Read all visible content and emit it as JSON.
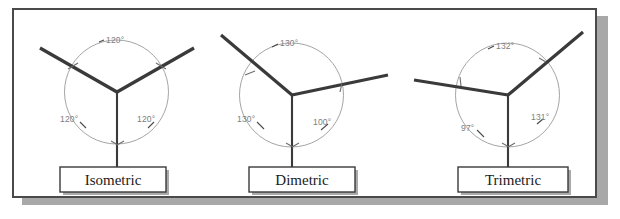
{
  "figure": {
    "background_color": "#ffffff",
    "frame_color": "#4a4a4a",
    "shadow_color": "#a8a8a8",
    "axis_color": "#3a3a3a",
    "arc_color": "#9a9a9a",
    "angle_label_color": "#7d7d7d"
  },
  "diagrams": [
    {
      "id": "isometric",
      "caption": "Isometric",
      "angles": {
        "top": "120°",
        "left": "120°",
        "right": "120°"
      }
    },
    {
      "id": "dimetric",
      "caption": "Dimetric",
      "angles": {
        "top": "130°",
        "left": "130°",
        "right": "100°"
      }
    },
    {
      "id": "trimetric",
      "caption": "Trimetric",
      "angles": {
        "top": "132°",
        "left": "97°",
        "right": "131°"
      }
    }
  ]
}
